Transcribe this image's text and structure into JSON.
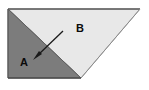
{
  "figure": {
    "background_color": "#ffffff",
    "outline_color": "#5a5a5a",
    "regions": [
      {
        "id": "region-b",
        "label": "B",
        "label_x": 80,
        "label_y": 32,
        "fill": "#e8e8e8",
        "description": "light gray upper-right triangle"
      },
      {
        "id": "region-a",
        "label": "A",
        "label_x": 24,
        "label_y": 66,
        "fill": "#7c7c7c",
        "description": "dark gray lower-left region"
      }
    ],
    "arrow": {
      "name": "pointer-arrow",
      "color": "#1a1a1a",
      "from_x": 63,
      "from_y": 31,
      "to_x": 34,
      "to_y": 59,
      "points_to": "A"
    },
    "vertices": {
      "top_left": [
        8,
        9
      ],
      "top_right": [
        140,
        9
      ],
      "bottom_apex": [
        81,
        78
      ],
      "bottom_left": [
        8,
        78
      ],
      "fold_mid": [
        47,
        47
      ]
    }
  }
}
